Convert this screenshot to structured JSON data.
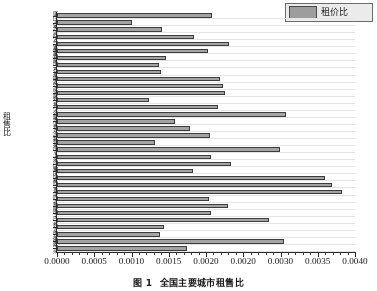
{
  "chart_data": {
    "type": "bar",
    "orientation": "horizontal",
    "title": "全国主要城市租售比",
    "xlabel": "",
    "ylabel": "租售比",
    "xlim": [
      0.0,
      0.004
    ],
    "grid": true,
    "legend_position": "top-right",
    "legend": [
      "租价比"
    ],
    "xticks": [
      "0.0000",
      "0.0005",
      "0.0010",
      "0.0015",
      "0.0020",
      "0.0020",
      "0.0030",
      "0.0035",
      "0.0040"
    ],
    "xtick_values": [
      0.0,
      0.0005,
      0.001,
      0.0015,
      0.002,
      0.0025,
      0.003,
      0.0035,
      0.004
    ],
    "categories": [
      "厦门",
      "宁波",
      "天津",
      "武汉",
      "乌鲁木齐",
      "南昌",
      "太原",
      "南宁",
      "石家庄",
      "济南",
      "住房",
      "沈阳",
      "郑州",
      "长沙",
      "合肥",
      "大连",
      "青岛",
      "深圳",
      "杭州",
      "南京",
      "上海",
      "海口",
      "重庆",
      "成都",
      "西宁",
      "银川",
      "西安",
      "昆明",
      "南宁",
      "广州",
      "北京",
      "哈尔滨",
      "济南",
      "兰州"
    ],
    "values": [
      0.00208,
      0.001,
      0.00141,
      0.00184,
      0.00231,
      0.00203,
      0.00146,
      0.00137,
      0.0014,
      0.00219,
      0.00223,
      0.00226,
      0.00124,
      0.00216,
      0.00307,
      0.00159,
      0.00178,
      0.00205,
      0.00131,
      0.00299,
      0.00207,
      0.00233,
      0.00182,
      0.0036,
      0.00369,
      0.00383,
      0.00204,
      0.00229,
      0.00207,
      0.00285,
      0.00143,
      0.00138,
      0.00305,
      0.00175
    ]
  },
  "legend": {
    "label": "租价比"
  },
  "axes": {
    "y_title": "租售比"
  },
  "caption": {
    "number": "图 1",
    "text": "全国主要城市租售比"
  }
}
